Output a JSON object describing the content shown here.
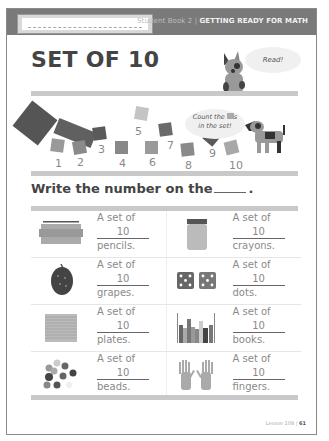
{
  "header": {
    "book_label": "Student Book 2 |",
    "series_title": "GETTING READY FOR MATH",
    "name_field_placeholder": ""
  },
  "title": "SET OF 10",
  "bubbles": {
    "read": "Read!",
    "count_line1": "Count the",
    "count_line1_suffix": "s",
    "count_line2": "in the set!"
  },
  "counting_numbers": [
    "1",
    "2",
    "3",
    "4",
    "5",
    "6",
    "7",
    "8",
    "9",
    "10"
  ],
  "instruction": {
    "text": "Write the number on the",
    "end": "."
  },
  "items": [
    {
      "prefix": "A set of",
      "value": "10",
      "noun": "pencils.",
      "icon": "pencils-icon"
    },
    {
      "prefix": "A set of",
      "value": "10",
      "noun": "crayons.",
      "icon": "crayons-icon"
    },
    {
      "prefix": "A set of",
      "value": "10",
      "noun": "grapes.",
      "icon": "grapes-icon"
    },
    {
      "prefix": "A set of",
      "value": "10",
      "noun": "dots.",
      "icon": "dice-icon"
    },
    {
      "prefix": "A set of",
      "value": "10",
      "noun": "plates.",
      "icon": "plates-icon"
    },
    {
      "prefix": "A set of",
      "value": "10",
      "noun": "books.",
      "icon": "books-icon"
    },
    {
      "prefix": "A set of",
      "value": "10",
      "noun": "beads.",
      "icon": "beads-icon"
    },
    {
      "prefix": "A set of",
      "value": "10",
      "noun": "fingers.",
      "icon": "hands-icon"
    }
  ],
  "footer": {
    "lesson": "Lesson 108 |",
    "page": "61"
  },
  "colors": {
    "header_bar": "#7a7a7a",
    "stripe": "#c9c9c9",
    "title": "#444444"
  }
}
